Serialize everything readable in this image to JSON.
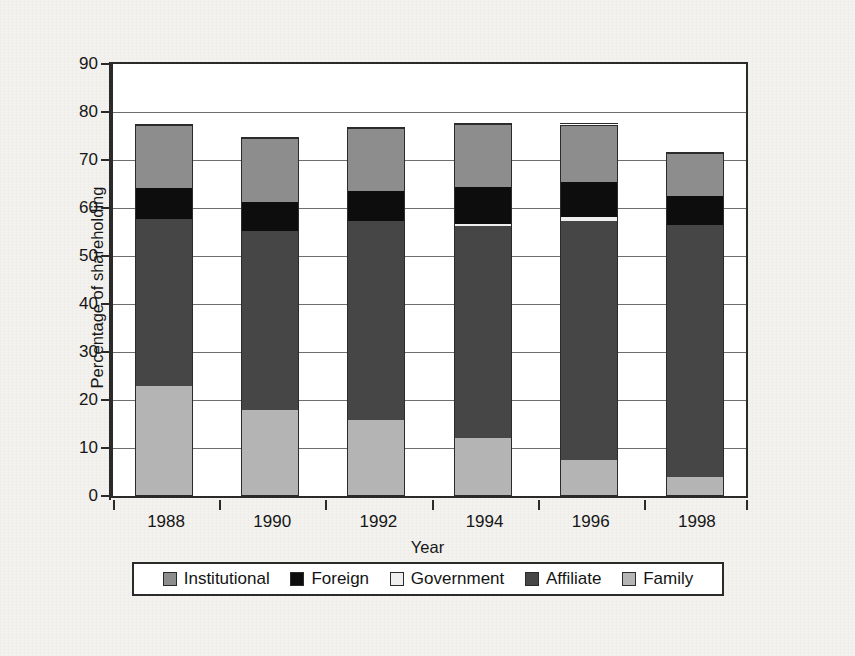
{
  "figure": {
    "background_color": "#f3f2ef",
    "plot_background_color": "#ffffff",
    "frame_color": "#2a2a2a"
  },
  "axes": {
    "y_title": "Percentage of shareholding",
    "x_title": "Year",
    "y_ticks": [
      "90",
      "80",
      "70",
      "60",
      "50",
      "40",
      "30",
      "20",
      "10",
      "0"
    ],
    "x_ticks": [
      "1988",
      "1990",
      "1992",
      "1994",
      "1996",
      "1998"
    ]
  },
  "legend": {
    "items": [
      {
        "label": "Institutional",
        "color": "#8d8d8d",
        "swatch": "legend-swatch-institutional"
      },
      {
        "label": "Foreign",
        "color": "#0d0d0d",
        "swatch": "legend-swatch-foreign"
      },
      {
        "label": "Government",
        "color": "#efefef",
        "swatch": "legend-swatch-government"
      },
      {
        "label": "Affiliate",
        "color": "#464646",
        "swatch": "legend-swatch-affiliate"
      },
      {
        "label": "Family",
        "color": "#b4b4b4",
        "swatch": "legend-swatch-family"
      }
    ]
  },
  "chart_data": {
    "type": "bar",
    "subtype": "stacked-vertical",
    "title": "",
    "xlabel": "Year",
    "ylabel": "Percentage of shareholding",
    "ylim": [
      0,
      90
    ],
    "ytick_step": 10,
    "grid": "horizontal",
    "legend_position": "below-axis",
    "categories": [
      "1988",
      "1990",
      "1992",
      "1994",
      "1996",
      "1998"
    ],
    "stack_order_bottom_to_top": [
      "Family",
      "Affiliate",
      "Government",
      "Foreign",
      "Institutional"
    ],
    "series": [
      {
        "name": "Family",
        "color": "#b4b4b4",
        "values": [
          23.0,
          18.0,
          15.8,
          12.0,
          7.6,
          3.9
        ]
      },
      {
        "name": "Affiliate",
        "color": "#464646",
        "values": [
          34.7,
          37.2,
          41.4,
          44.2,
          49.7,
          52.6
        ]
      },
      {
        "name": "Government",
        "color": "#efefef",
        "values": [
          0.0,
          0.0,
          0.0,
          0.5,
          0.8,
          0.0
        ]
      },
      {
        "name": "Foreign",
        "color": "#0d0d0d",
        "values": [
          6.5,
          6.0,
          6.4,
          7.6,
          7.4,
          6.0
        ]
      },
      {
        "name": "Institutional",
        "color": "#8d8d8d",
        "values": [
          13.0,
          13.4,
          13.0,
          13.3,
          11.9,
          9.0
        ]
      }
    ],
    "cumulative_tops": {
      "1988": {
        "Family": 23.0,
        "Affiliate": 57.7,
        "Government": 57.7,
        "Foreign": 64.2,
        "Institutional": 77.2
      },
      "1990": {
        "Family": 18.0,
        "Affiliate": 55.2,
        "Government": 55.2,
        "Foreign": 61.2,
        "Institutional": 74.6
      },
      "1992": {
        "Family": 15.8,
        "Affiliate": 57.2,
        "Government": 57.2,
        "Foreign": 63.6,
        "Institutional": 76.6
      },
      "1994": {
        "Family": 12.0,
        "Affiliate": 56.2,
        "Government": 56.7,
        "Foreign": 64.3,
        "Institutional": 77.6
      },
      "1996": {
        "Family": 7.6,
        "Affiliate": 57.3,
        "Government": 58.1,
        "Foreign": 65.5,
        "Institutional": 77.4
      },
      "1998": {
        "Family": 3.9,
        "Affiliate": 56.5,
        "Government": 56.5,
        "Foreign": 62.5,
        "Institutional": 71.5
      }
    },
    "totals": [
      77.2,
      74.6,
      76.6,
      77.6,
      77.4,
      71.5
    ]
  }
}
